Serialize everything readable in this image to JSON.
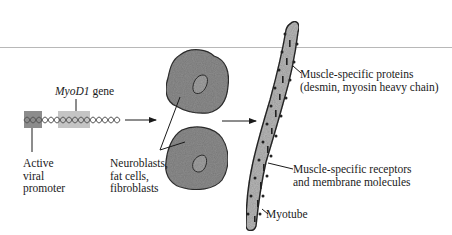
{
  "figure": {
    "type": "biology-schematic"
  },
  "dna": {
    "gene_label_italic": "MyoD1",
    "gene_label_suffix": " gene",
    "promoter_label_lines": [
      "Active",
      "viral",
      "promoter"
    ],
    "colors": {
      "promoter_box": "#8c8c8c",
      "gene_box": "#c4c4c4",
      "helix": "#555555"
    }
  },
  "cells": {
    "label_lines": [
      "Neuroblasts,",
      "fat cells,",
      "fibroblasts"
    ],
    "colors": {
      "cell_fill": "#8f8f8f",
      "cell_outline": "#333333",
      "nucleus_fill": "#a3a3a3"
    }
  },
  "myotube": {
    "label": "Myotube",
    "proteins_label_lines": [
      "Muscle-specific proteins",
      "(desmin, myosin heavy chain)"
    ],
    "receptors_label_lines": [
      "Muscle-specific receptors",
      "and membrane molecules"
    ],
    "colors": {
      "fill": "#b9b9b9",
      "outline": "#2a2a2a",
      "marks": "#222222"
    }
  },
  "arrows": [
    {
      "from": "dna",
      "to": "cells"
    },
    {
      "from": "cells",
      "to": "myotube"
    }
  ]
}
